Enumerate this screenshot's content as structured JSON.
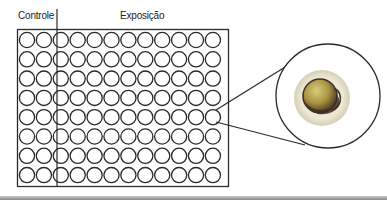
{
  "labels": {
    "control": "Controle",
    "exposure": "Exposição"
  },
  "plate": {
    "rows": 8,
    "columns": 12,
    "control_columns": 2,
    "exposure_columns": 10,
    "highlighted_well": {
      "row": 5,
      "column": 12
    }
  },
  "magnified_view": {
    "description": "Magnified well showing a single embryo/egg",
    "colors": {
      "chorion": "#eeeadb",
      "yolk": "#b5a24a",
      "dark_tissue": "#3d2f24"
    }
  },
  "colors": {
    "stroke": "#2a2a2a",
    "background": "#ffffff"
  }
}
